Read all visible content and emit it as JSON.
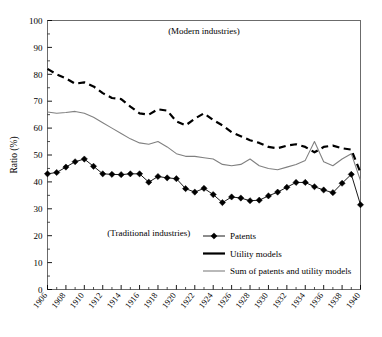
{
  "chart_data": {
    "type": "line",
    "title": "",
    "xlabel": "",
    "ylabel": "Ratio (%)",
    "ylim": [
      0,
      100
    ],
    "xlim": [
      1906,
      1940
    ],
    "ytick_step": 10,
    "grid": false,
    "legend_position": "bottom-right",
    "yticks": [
      "0",
      "10",
      "20",
      "30",
      "40",
      "50",
      "60",
      "70",
      "80",
      "90",
      "100"
    ],
    "x": [
      1906,
      1907,
      1908,
      1909,
      1910,
      1911,
      1912,
      1913,
      1914,
      1915,
      1916,
      1917,
      1918,
      1919,
      1920,
      1921,
      1922,
      1923,
      1924,
      1925,
      1926,
      1927,
      1928,
      1929,
      1930,
      1931,
      1932,
      1933,
      1934,
      1935,
      1936,
      1937,
      1938,
      1939,
      1940
    ],
    "xtick_labels": [
      "1906",
      "1908",
      "1910",
      "1912",
      "1914",
      "1916",
      "1918",
      "1920",
      "1922",
      "1924",
      "1926",
      "1928",
      "1930",
      "1932",
      "1934",
      "1936",
      "1938",
      "1940"
    ],
    "annotations": [
      {
        "text": "(Modern industries)",
        "x": 1923,
        "y": 95
      },
      {
        "text": "(Traditional industries)",
        "x": 1917,
        "y": 20
      }
    ],
    "series": [
      {
        "name": "Patents",
        "style": "line-markers",
        "color": "#000000",
        "marker": "diamond",
        "values": [
          43.0,
          43.5,
          45.5,
          47.5,
          48.5,
          45.8,
          43.0,
          42.8,
          42.7,
          43.0,
          43.0,
          39.9,
          42.0,
          41.5,
          41.2,
          37.5,
          36.2,
          37.6,
          35.3,
          32.3,
          34.4,
          34.0,
          33.0,
          33.2,
          34.8,
          36.2,
          38.0,
          39.8,
          39.8,
          38.2,
          37.0,
          36.0,
          39.5,
          42.8,
          31.5
        ]
      },
      {
        "name": "Utility models",
        "style": "dashed",
        "color": "#000000",
        "marker": "none",
        "values": [
          82.0,
          80.0,
          78.5,
          76.5,
          77.0,
          75.5,
          73.0,
          71.2,
          70.8,
          68.0,
          65.5,
          65.0,
          67.0,
          66.5,
          62.5,
          61.0,
          63.5,
          65.5,
          63.0,
          61.0,
          58.5,
          57.0,
          55.5,
          54.5,
          53.0,
          52.5,
          53.5,
          54.0,
          53.0,
          51.0,
          53.0,
          53.5,
          52.5,
          52.0,
          43.5
        ]
      },
      {
        "name": "Sum of patents and utility models",
        "style": "solid-thin",
        "color": "#808080",
        "marker": "none",
        "values": [
          66.0,
          65.5,
          65.8,
          66.2,
          65.5,
          64.0,
          62.0,
          60.0,
          58.0,
          56.0,
          54.5,
          54.0,
          55.0,
          53.0,
          50.5,
          49.5,
          49.5,
          49.0,
          48.5,
          46.5,
          46.0,
          46.5,
          48.5,
          46.0,
          45.0,
          44.5,
          45.5,
          46.5,
          48.0,
          55.0,
          47.5,
          46.0,
          48.5,
          50.5,
          40.5
        ]
      }
    ],
    "legend": [
      {
        "label": "Patents",
        "style": "line-markers",
        "color": "#000000"
      },
      {
        "label": "Utility models",
        "style": "dashed",
        "color": "#000000"
      },
      {
        "label": "Sum of patents and utility models",
        "style": "solid-thin",
        "color": "#808080"
      }
    ]
  }
}
